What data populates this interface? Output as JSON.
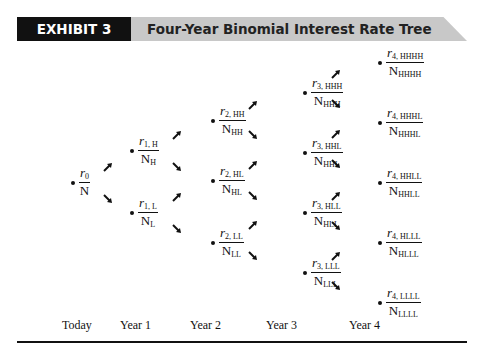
{
  "header": {
    "label": "EXHIBIT 3",
    "title": "Four-Year Binomial Interest Rate Tree"
  },
  "tree": {
    "today": {
      "r": "r",
      "r_sub": "0",
      "n": "N",
      "n_sub": ""
    },
    "year1": [
      {
        "r": "r",
        "r_sub": "1, H",
        "n": "N",
        "n_sub": "H"
      },
      {
        "r": "r",
        "r_sub": "1, L",
        "n": "N",
        "n_sub": "L"
      }
    ],
    "year2": [
      {
        "r": "r",
        "r_sub": "2, HH",
        "n": "N",
        "n_sub": "HH"
      },
      {
        "r": "r",
        "r_sub": "2, HL",
        "n": "N",
        "n_sub": "HL"
      },
      {
        "r": "r",
        "r_sub": "2, LL",
        "n": "N",
        "n_sub": "LL"
      }
    ],
    "year3": [
      {
        "r": "r",
        "r_sub": "3, HHH",
        "n": "N",
        "n_sub": "HHH"
      },
      {
        "r": "r",
        "r_sub": "3, HHL",
        "n": "N",
        "n_sub": "HHL"
      },
      {
        "r": "r",
        "r_sub": "3, HLL",
        "n": "N",
        "n_sub": "HLL"
      },
      {
        "r": "r",
        "r_sub": "3, LLL",
        "n": "N",
        "n_sub": "LLL"
      }
    ],
    "year4": [
      {
        "r": "r",
        "r_sub": "4, HHHH",
        "n": "N",
        "n_sub": "HHHH"
      },
      {
        "r": "r",
        "r_sub": "4, HHHL",
        "n": "N",
        "n_sub": "HHHL"
      },
      {
        "r": "r",
        "r_sub": "4, HHLL",
        "n": "N",
        "n_sub": "HHLL"
      },
      {
        "r": "r",
        "r_sub": "4, HLLL",
        "n": "N",
        "n_sub": "HLLL"
      },
      {
        "r": "r",
        "r_sub": "4, LLLL",
        "n": "N",
        "n_sub": "LLLL"
      }
    ]
  },
  "axis": {
    "labels": [
      "Today",
      "Year 1",
      "Year 2",
      "Year 3",
      "Year 4"
    ]
  }
}
